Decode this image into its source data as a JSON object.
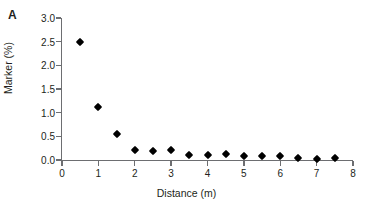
{
  "panel": {
    "label": "A"
  },
  "chart_data": {
    "type": "scatter",
    "title": "",
    "xlabel": "Distance (m)",
    "ylabel": "Marker (%)",
    "xlim": [
      0,
      8
    ],
    "ylim": [
      0,
      3.0
    ],
    "xticks": [
      0,
      1,
      2,
      3,
      4,
      5,
      6,
      7,
      8
    ],
    "xtick_labels": [
      "0",
      "1",
      "2",
      "3",
      "4",
      "5",
      "6",
      "7",
      "8"
    ],
    "yticks": [
      0.0,
      0.5,
      1.0,
      1.5,
      2.0,
      2.5,
      3.0
    ],
    "ytick_labels": [
      "0.0",
      "0.5",
      "1.0",
      "1.5",
      "2.0",
      "2.5",
      "3.0"
    ],
    "grid": false,
    "legend": false,
    "marker_style": "filled-diamond",
    "marker_color": "#000000",
    "axis_color": "#6d6e71",
    "x": [
      0.5,
      1.0,
      1.5,
      2.0,
      2.5,
      3.0,
      3.5,
      4.0,
      4.5,
      5.0,
      5.5,
      6.0,
      6.5,
      7.0,
      7.5
    ],
    "y": [
      2.5,
      1.11,
      0.55,
      0.21,
      0.19,
      0.21,
      0.1,
      0.1,
      0.12,
      0.08,
      0.08,
      0.08,
      0.05,
      0.03,
      0.05
    ]
  }
}
